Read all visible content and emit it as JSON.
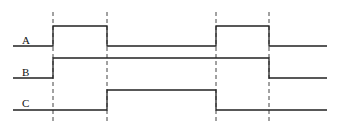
{
  "diagram": {
    "type": "timing-diagram",
    "signals": [
      {
        "label": "A",
        "levels": [
          "low",
          "high",
          "low",
          "high",
          "low"
        ]
      },
      {
        "label": "B",
        "levels": [
          "low",
          "high",
          "high",
          "high",
          "low"
        ]
      },
      {
        "label": "C",
        "levels": [
          "low",
          "low",
          "high",
          "low",
          "low"
        ]
      }
    ],
    "transition_markers": 4,
    "colors": {
      "line": "#222222",
      "dash": "#444444",
      "background": "#ffffff"
    }
  }
}
